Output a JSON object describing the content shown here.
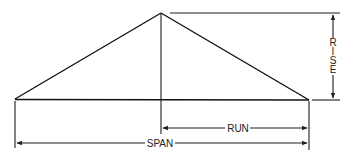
{
  "diagram": {
    "type": "roof-framing-dimensions",
    "labels": {
      "rise": "RISE",
      "rise_letters": [
        "R",
        "I",
        "S",
        "E"
      ],
      "run": "RUN",
      "span": "SPAN"
    },
    "colors": {
      "line": "#1e1e1e",
      "background": "#ffffff"
    }
  }
}
